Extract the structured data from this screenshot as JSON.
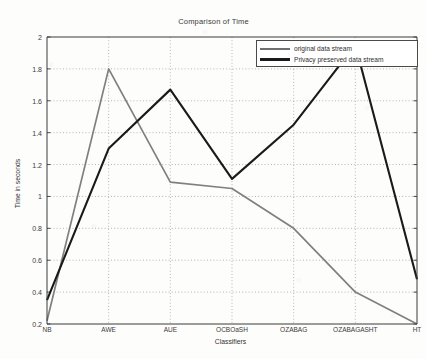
{
  "chart_data": {
    "type": "line",
    "title": "Comparison of Time",
    "xlabel": "Classifiers",
    "ylabel": "Time in seconds",
    "categories": [
      "NB",
      "AWE",
      "AUE",
      "OCBOaSH",
      "OZABAG",
      "OZABAGASHT",
      "HT"
    ],
    "series": [
      {
        "name": "original data stream",
        "color": "#808080",
        "values": [
          0.22,
          1.8,
          1.09,
          1.05,
          0.8,
          0.4,
          0.2
        ]
      },
      {
        "name": "Privacy preserved data stream",
        "color": "#1a1a1a",
        "values": [
          0.35,
          1.3,
          1.67,
          1.11,
          1.45,
          1.95,
          0.48
        ]
      }
    ],
    "ylim": [
      0.2,
      2.0
    ],
    "yticks": [
      0.2,
      0.4,
      0.6,
      0.8,
      1.0,
      1.2,
      1.4,
      1.6,
      1.8,
      2.0
    ],
    "ytick_labels": [
      "0.2",
      "0.4",
      "0.6",
      "0.8",
      "1",
      "1.2",
      "1.4",
      "1.6",
      "1.8",
      "2"
    ],
    "grid": true,
    "grid_style": "dotted",
    "legend_position": "top-right"
  }
}
